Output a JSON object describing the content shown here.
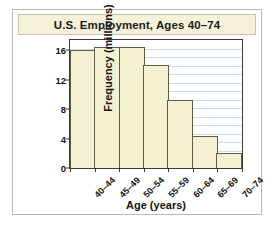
{
  "chart_data": {
    "type": "bar",
    "title": "U.S. Employment, Ages 40–74",
    "xlabel": "Age (years)",
    "ylabel": "Frequency (millions)",
    "categories": [
      "40–44",
      "45–49",
      "50–54",
      "55–59",
      "60–64",
      "65–69",
      "70–74"
    ],
    "values": [
      16.0,
      16.4,
      16.5,
      14.0,
      9.3,
      4.3,
      2.0
    ],
    "ytick_labels": [
      "0",
      "4",
      "8",
      "12",
      "16"
    ],
    "ytick_values": [
      0,
      4,
      8,
      12,
      16
    ],
    "ylim": [
      0,
      17.4
    ],
    "grid": "horizontal",
    "gridline_count": 14,
    "legend": "none",
    "bar_fill_color": "#f4f0d2",
    "bar_edge_color": "#5f5c4a",
    "gridline_color": "#c8dff0",
    "axis_color": "#3b3b33",
    "title_band_color": "#f6f2da",
    "card_border_color": "#b9b9b4",
    "background_color": "#ffffff"
  }
}
